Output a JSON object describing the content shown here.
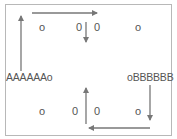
{
  "diagram": {
    "labels": {
      "left": "AAAAAAo",
      "right": "oBBBBBB"
    },
    "top_row": [
      "o",
      "0",
      "0",
      "o"
    ],
    "bottom_row": [
      "o",
      "0",
      "0",
      "o"
    ],
    "arrows": [
      {
        "name": "left-up",
        "direction": "up"
      },
      {
        "name": "top-right",
        "direction": "right"
      },
      {
        "name": "top-middle-down",
        "direction": "down"
      },
      {
        "name": "right-down",
        "direction": "down"
      },
      {
        "name": "bottom-left",
        "direction": "left"
      },
      {
        "name": "bottom-middle-up",
        "direction": "up"
      }
    ],
    "colors": {
      "arrow": "#777777",
      "border": "#b8b8b8",
      "text": "#555555"
    }
  }
}
